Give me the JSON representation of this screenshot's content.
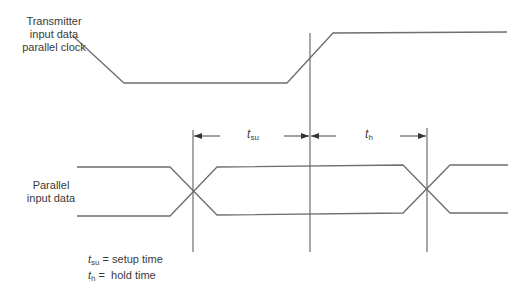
{
  "labels": {
    "clock_line1": "Transmitter",
    "clock_line2": "input data",
    "clock_line3": "parallel clock",
    "data_line1": "Parallel",
    "data_line2": "input data",
    "tsu_t": "t",
    "tsu_sub": "su",
    "th_t": "t",
    "th_sub": "h"
  },
  "legend": {
    "tsu_t": "t",
    "tsu_sub": "su",
    "tsu_desc": " = setup time",
    "th_t": "t",
    "th_sub": "h",
    "th_desc": " =  hold time"
  },
  "colors": {
    "line": "#6e6e6e",
    "text": "#3a3a3a"
  }
}
